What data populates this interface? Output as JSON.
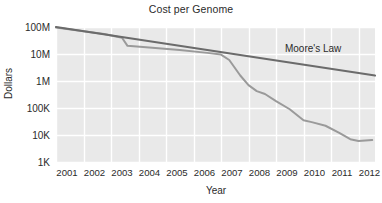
{
  "chart_data": {
    "type": "line",
    "title": "Cost per Genome",
    "xlabel": "Year",
    "ylabel": "Dollars",
    "yscale": "log",
    "grid": true,
    "legend_position": "inline-annotation",
    "xlim": [
      2001,
      2012.6
    ],
    "ylim": [
      1000,
      100000000
    ],
    "x_tick_labels": [
      "2001",
      "2002",
      "2003",
      "2004",
      "2005",
      "2006",
      "2007",
      "2008",
      "2009",
      "2010",
      "2011",
      "2012"
    ],
    "x_tick_values": [
      2001,
      2002,
      2003,
      2004,
      2005,
      2006,
      2007,
      2008,
      2009,
      2010,
      2011,
      2012
    ],
    "y_tick_labels": [
      "100M",
      "10M",
      "1M",
      "100K",
      "10K",
      "1K"
    ],
    "y_tick_values": [
      100000000,
      10000000,
      1000000,
      100000,
      10000,
      1000
    ],
    "series": [
      {
        "name": "Cost per Genome",
        "color": "#9a9a9a",
        "annotation": "",
        "x": [
          2001.0,
          2002.0,
          2002.75,
          2003.4,
          2003.6,
          2004.5,
          2005.5,
          2006.5,
          2007.0,
          2007.3,
          2007.7,
          2008.0,
          2008.3,
          2008.6,
          2009.0,
          2009.5,
          2010.0,
          2010.3,
          2010.8,
          2011.3,
          2011.7,
          2012.0,
          2012.5
        ],
        "values": [
          95000000,
          70000000,
          55000000,
          40000000,
          20000000,
          17000000,
          14000000,
          11000000,
          9500000,
          6000000,
          1600000,
          700000,
          420000,
          330000,
          180000,
          90000,
          35000,
          30000,
          22000,
          12000,
          7000,
          6000,
          6500
        ]
      },
      {
        "name": "Moore's Law",
        "color": "#6b6b6b",
        "annotation": "Moore's Law",
        "x": [
          2001.0,
          2012.6
        ],
        "values": [
          100000000,
          1600000
        ]
      }
    ],
    "annotations": [
      {
        "text": "Moore's Law",
        "x": 2010.35,
        "y": 12000000
      }
    ],
    "colors": {
      "plot_background": "#e9e9e9",
      "gridline": "#ffffff",
      "page_background": "#ffffff",
      "text": "#2b2b2b",
      "cost_line": "#9a9a9a",
      "moores_law_line": "#6b6b6b"
    }
  }
}
